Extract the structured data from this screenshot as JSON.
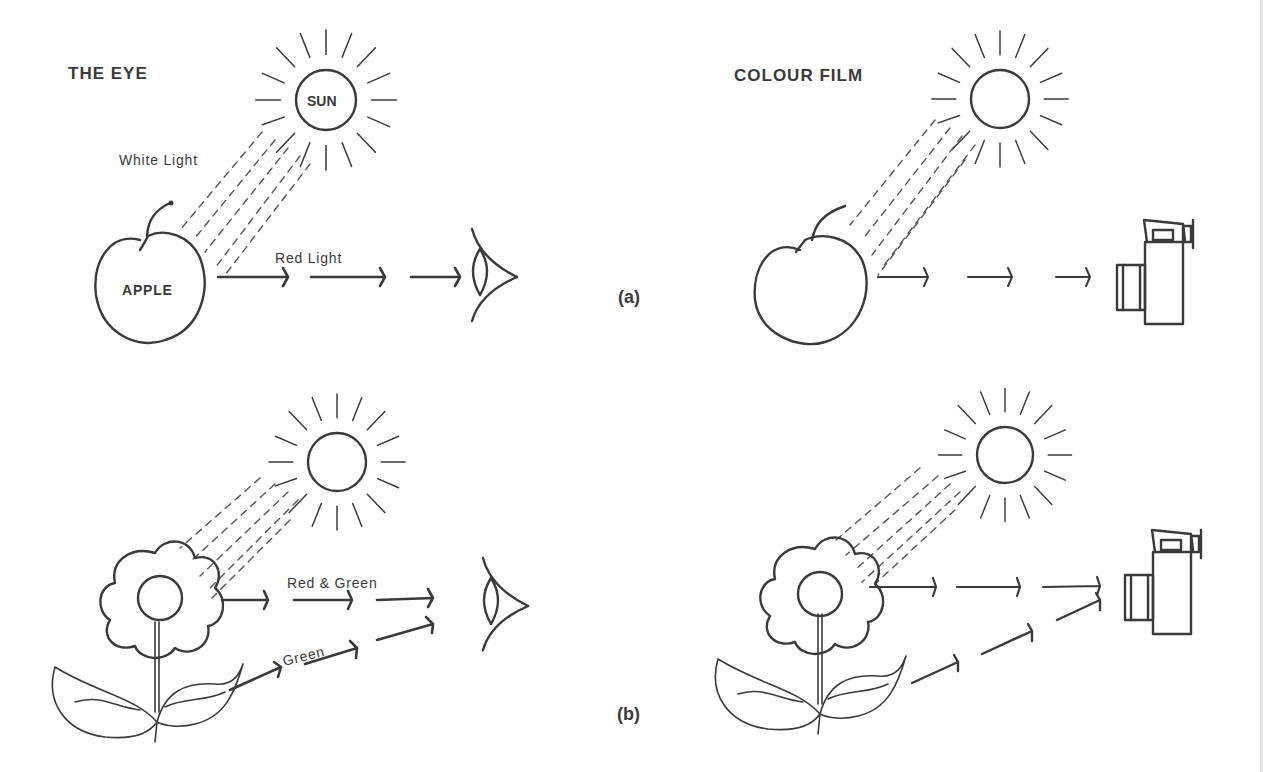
{
  "figure": {
    "left_column_title": "THE EYE",
    "right_column_title": "COLOUR FILM",
    "panel_a_label": "(a)",
    "panel_b_label": "(b)"
  },
  "panel_a": {
    "left": {
      "sun_label": "SUN",
      "incident_label": "White Light",
      "object_label": "APPLE",
      "reflected_label": "Red Light",
      "receiver": "eye-icon"
    },
    "right": {
      "sun_label": "",
      "object": "apple",
      "receiver": "camera-icon"
    }
  },
  "panel_b": {
    "left": {
      "reflected_flower_label": "Red & Green",
      "reflected_leaf_label": "Green",
      "object": "flower-with-leaves",
      "receiver": "eye-icon"
    },
    "right": {
      "object": "flower-with-leaves",
      "receiver": "camera-icon"
    }
  },
  "colors": {
    "ink": "#3a3a3a",
    "background": "#ffffff"
  }
}
